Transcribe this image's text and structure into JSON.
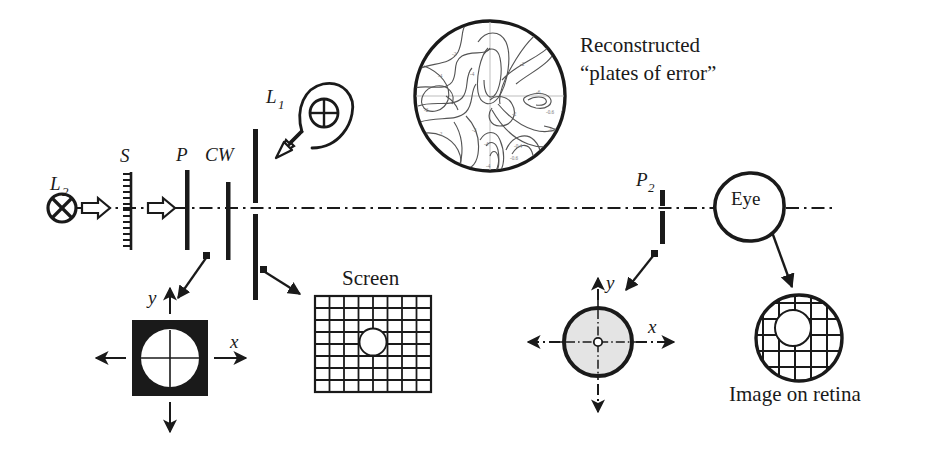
{
  "figure": {
    "background_color": "#ffffff",
    "ink_color": "#1a1a1a",
    "gray_fill_color": "#e2e2e2",
    "contour_line_color": "#555555"
  },
  "optical_axis": {
    "name": "optical-axis",
    "style": "dash-dot",
    "x_start": 72,
    "x_end": 836,
    "y": 208
  },
  "components": [
    {
      "id": "L2",
      "label": "L",
      "subscript": "2",
      "kind": "lamp-crossed-circle",
      "label_x": 57,
      "label_y": 186
    },
    {
      "id": "S",
      "label": "S",
      "subscript": "",
      "kind": "hatched-diffuser",
      "label_x": 126,
      "label_y": 160
    },
    {
      "id": "P1",
      "label": "P",
      "subscript": "1",
      "kind": "vertical-bar",
      "label_x": 178,
      "label_y": 160
    },
    {
      "id": "CW",
      "label": "CW",
      "subscript": "",
      "kind": "vertical-bar",
      "label_x": 211,
      "label_y": 160
    },
    {
      "id": "L1",
      "label": "L",
      "subscript": "1",
      "kind": "lens-crossed-circle-with-hook",
      "label_x": 272,
      "label_y": 101
    },
    {
      "id": "P2",
      "label": "P",
      "subscript": "2",
      "kind": "split-vertical-bar",
      "label_x": 700,
      "label_y": 184
    }
  ],
  "annotations": {
    "reconstructed_line1": "Reconstructed",
    "reconstructed_line2": "“plates of error”",
    "screen_label": "Screen",
    "eye_label": "Eye",
    "retina_label": "Image on retina"
  },
  "axes_labels": {
    "black_square_y": "y",
    "black_square_x": "x",
    "gray_circle_y": "y",
    "gray_circle_x": "x"
  },
  "screen_grid": {
    "name": "screen-grid",
    "columns": 8,
    "rows": 8,
    "x": 315,
    "y": 296,
    "width": 116,
    "height": 96,
    "spot_cx": 373,
    "spot_cy": 342,
    "spot_r": 13
  },
  "black_square_target": {
    "name": "black-square-target",
    "x": 132,
    "y": 320,
    "size": 76,
    "circle_r": 29
  },
  "gray_circle_target": {
    "name": "gray-circle-target",
    "cx": 598,
    "cy": 342,
    "r": 34,
    "hub_r": 4
  },
  "retina_image": {
    "name": "retina-image",
    "cx": 799,
    "cy": 338,
    "r": 43,
    "inner_cx": 793,
    "inner_cy": 328,
    "inner_r": 18,
    "grid_spacing": 16
  },
  "reconstructed_plate": {
    "name": "reconstructed-plate-circle",
    "cx": 490,
    "cy": 96,
    "r": 76
  },
  "eye": {
    "name": "eye-outline",
    "cx": 749,
    "cy": 207,
    "r": 34
  }
}
